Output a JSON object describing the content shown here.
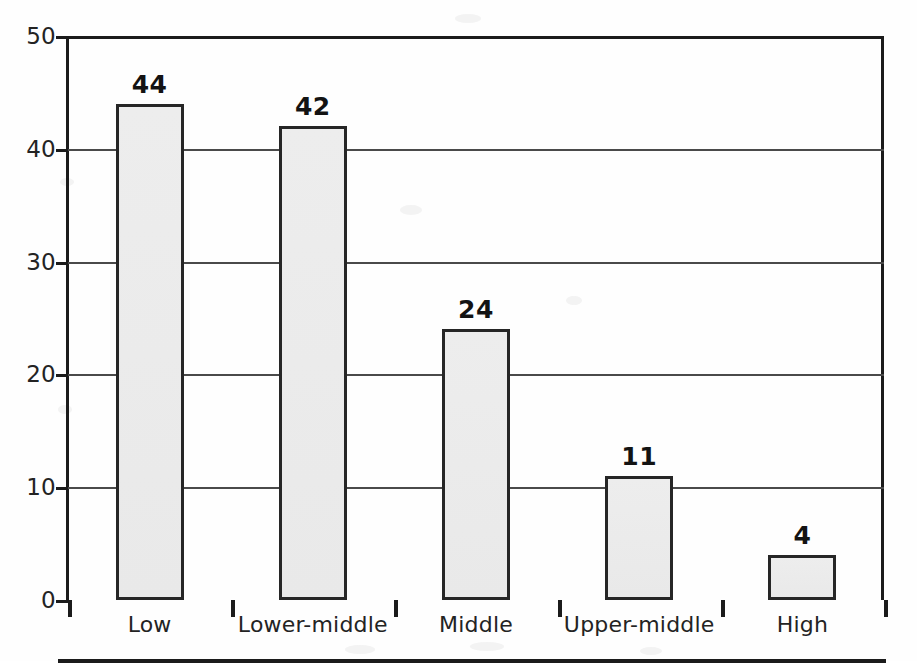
{
  "chart_data": {
    "type": "bar",
    "title": "",
    "subtitle": "",
    "xlabel": "",
    "ylabel": "",
    "categories": [
      "Low",
      "Lower-middle",
      "Middle",
      "Upper-middle",
      "High"
    ],
    "values": [
      44,
      42,
      24,
      11,
      4
    ],
    "data_labels": [
      "44",
      "42",
      "24",
      "11",
      "4"
    ],
    "ylim": [
      0,
      50
    ],
    "y_ticks": [
      0,
      10,
      20,
      30,
      40,
      50
    ],
    "y_tick_labels": [
      "0",
      "10",
      "20",
      "30",
      "40",
      "50"
    ],
    "grid": "horizontal",
    "gridlines_at": [
      10,
      20,
      30,
      40
    ],
    "legend": null,
    "legend_position": "none",
    "bar_fill_color": "#ebebeb",
    "bar_border_color": "#262626",
    "axis_color": "#1b1b1b",
    "gridline_color": "#4a4a4a",
    "label_text_color": "#131313",
    "background_color": "#ffffff",
    "x_tick_style": "category-boundaries",
    "annotations": []
  }
}
